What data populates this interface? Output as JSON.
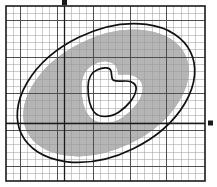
{
  "figure": {
    "type": "geometric-diagram",
    "canvas": {
      "width": 217,
      "height": 187
    },
    "colors": {
      "background": "#ffffff",
      "shaded_cell": "#b5b5b5",
      "grid_minor": "#9a9a9a",
      "grid_major": "#4a4a4a",
      "frame": "#1a1a1a",
      "axis": "#1a1a1a",
      "curve": "#111111"
    },
    "frame": {
      "x": 6,
      "y": 6,
      "width": 199,
      "height": 175,
      "stroke_width": 1.6
    },
    "grid": {
      "cell_size": 7.3,
      "minor_stroke_width": 0.5,
      "major_stroke_width": 1.0,
      "major_every": 5,
      "columns": 27,
      "rows": 24,
      "visible": true
    },
    "axes": {
      "x_axis": {
        "y": 123.5,
        "label": "",
        "arrow_end": "right",
        "visible": true
      },
      "y_axis": {
        "x": 64.5,
        "label": "",
        "arrow_end": "top",
        "visible": true
      },
      "arrow_marker_size": 4
    },
    "ellipse": {
      "name": "outer-boundary-ellipse",
      "center_x": 106,
      "center_y": 93,
      "radius_x": 94,
      "radius_y": 62,
      "rotation_deg": -26,
      "stroke_width": 1.7,
      "fill": "none"
    },
    "hole": {
      "name": "inner-hole-curve",
      "stroke_width": 1.7,
      "fill": "none",
      "path": "M 97 70 C 92 72 88 78 88 87 C 88 98 90 107 94 112 C 99 118 110 118 119 112 C 128 106 135 97 136 90 C 137 84 132 81 126 81 C 120 81 116 82 113 80 C 111 78 112 74 111 71 C 110 67 103 67 97 70 Z"
    },
    "shaded_cells": {
      "description": "grid squares fully contained between the ellipse and the hole",
      "count": 214
    }
  }
}
